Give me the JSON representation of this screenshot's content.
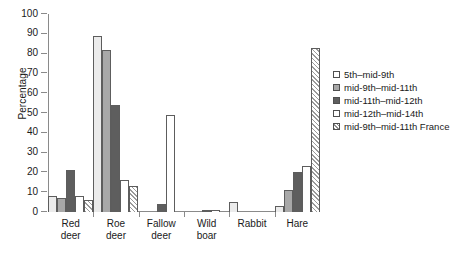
{
  "chart_data": {
    "type": "bar",
    "title": "",
    "subtitle": "",
    "xlabel": "",
    "ylabel": "Percentage",
    "ylim": [
      0,
      100
    ],
    "ytick_step": 10,
    "yticks": [
      0,
      10,
      20,
      30,
      40,
      50,
      60,
      70,
      80,
      90,
      100
    ],
    "ytick_labels": [
      "0",
      "10",
      "20",
      "30",
      "40",
      "50",
      "60",
      "70",
      "80",
      "90",
      "100"
    ],
    "grid": false,
    "legend_position": "right",
    "categories": [
      "Red\ndeer",
      "Roe\ndeer",
      "Fallow\ndeer",
      "Wild\nboar",
      "Rabbit",
      "Hare"
    ],
    "category_labels": [
      "Red deer",
      "Roe deer",
      "Fallow deer",
      "Wild boar",
      "Rabbit",
      "Hare"
    ],
    "series": [
      {
        "name": "5th–mid-9th",
        "color": "#ebebeb",
        "pattern": "solid",
        "values": [
          8,
          89,
          0,
          0,
          5,
          3
        ]
      },
      {
        "name": "mid-9th–mid-11th",
        "color": "#a8a8a8",
        "pattern": "solid",
        "values": [
          7,
          82,
          0,
          0,
          0,
          11
        ]
      },
      {
        "name": "mid-11th–mid-12th",
        "color": "#5e5e5e",
        "pattern": "solid",
        "values": [
          21,
          54,
          4,
          1,
          0,
          20
        ]
      },
      {
        "name": "mid-12th–mid-14th",
        "color": "#ffffff",
        "pattern": "solid",
        "values": [
          8,
          16,
          49,
          1,
          0,
          23
        ]
      },
      {
        "name": "mid-9th–mid-11th France",
        "color": "#ffffff",
        "pattern": "diagonal-hatch",
        "values": [
          6,
          13,
          0,
          0,
          0,
          83
        ]
      }
    ]
  },
  "axis": {
    "y_title": "Percentage"
  },
  "legend": {
    "items": [
      {
        "label": "5th–mid-9th"
      },
      {
        "label": "mid-9th–mid-11th"
      },
      {
        "label": "mid-11th–mid-12th"
      },
      {
        "label": "mid-12th–mid-14th"
      },
      {
        "label": "mid-9th–mid-11th France"
      }
    ]
  }
}
